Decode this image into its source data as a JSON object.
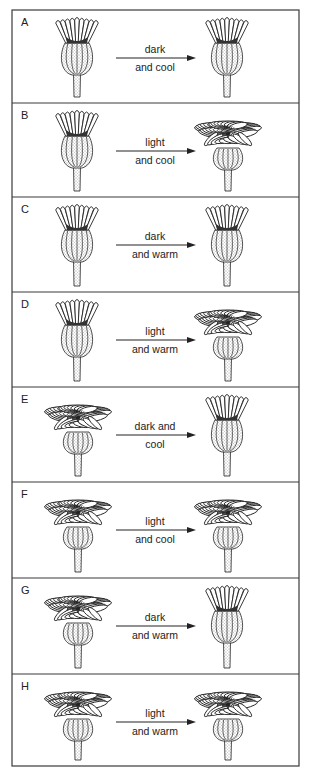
{
  "figure": {
    "panels": [
      {
        "label": "A",
        "from": "closed",
        "to": "closed",
        "condition_line1": "dark",
        "condition_line2": "and cool"
      },
      {
        "label": "B",
        "from": "closed",
        "to": "open",
        "condition_line1": "light",
        "condition_line2": "and cool"
      },
      {
        "label": "C",
        "from": "closed",
        "to": "closed",
        "condition_line1": "dark",
        "condition_line2": "and warm"
      },
      {
        "label": "D",
        "from": "closed",
        "to": "open",
        "condition_line1": "light",
        "condition_line2": "and warm"
      },
      {
        "label": "E",
        "from": "open",
        "to": "closed",
        "condition_line1": "dark and",
        "condition_line2": "cool"
      },
      {
        "label": "F",
        "from": "open",
        "to": "open",
        "condition_line1": "light",
        "condition_line2": "and cool"
      },
      {
        "label": "G",
        "from": "open",
        "to": "closed",
        "condition_line1": "dark",
        "condition_line2": "and warm"
      },
      {
        "label": "H",
        "from": "open",
        "to": "open",
        "condition_line1": "light",
        "condition_line2": "and warm"
      }
    ],
    "colors": {
      "ink": "#222222",
      "background": "#ffffff"
    }
  }
}
